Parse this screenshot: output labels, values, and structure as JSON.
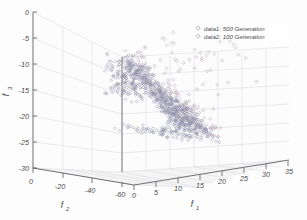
{
  "chart_data": {
    "type": "scatter",
    "title": "",
    "projection": "3d",
    "xlabel": "f_1",
    "ylabel": "f_2",
    "zlabel": "f_3",
    "xlabel_base": "f",
    "xlabel_sub": "1",
    "ylabel_base": "f",
    "ylabel_sub": "2",
    "zlabel_base": "f",
    "zlabel_sub": "3",
    "xlim": [
      0,
      35
    ],
    "ylim": [
      0,
      -60
    ],
    "zlim": [
      -30,
      0
    ],
    "xticks": [
      "0",
      "5",
      "10",
      "15",
      "20",
      "25",
      "30",
      "35"
    ],
    "xtick_values": [
      0,
      5,
      10,
      15,
      20,
      25,
      30,
      35
    ],
    "yticks": [
      "0",
      "-20",
      "-40",
      "-60"
    ],
    "ytick_values": [
      0,
      -20,
      -40,
      -60
    ],
    "zticks": [
      "0",
      "-5",
      "-10",
      "-15",
      "-20",
      "-25",
      "-30"
    ],
    "ztick_values": [
      0,
      -5,
      -10,
      -15,
      -20,
      -25,
      -30
    ],
    "grid": true,
    "legend_position": "upper-right",
    "marker": "diamond",
    "series": [
      {
        "name": "data1: 500 Generation",
        "label": "data1: 500 Generation",
        "color": "#8e8ea8",
        "marker": "diamond",
        "count": 500,
        "generation": 500,
        "description": "dense descending band from upper-left to lower-right"
      },
      {
        "name": "data2: 100 Generation",
        "label": "data2: 100 Generation",
        "color": "#a78fa0",
        "marker": "diamond",
        "count": 100,
        "generation": 100,
        "description": "sparser scattered points including right-side outliers"
      }
    ]
  },
  "legend": {
    "entries": [
      {
        "label": "data1: 500 Generation"
      },
      {
        "label": "data2: 100 Generation"
      }
    ]
  },
  "axes": {
    "x": {
      "label_base": "f",
      "label_sub": "1",
      "ticks": [
        "0",
        "5",
        "10",
        "15",
        "20",
        "25",
        "30",
        "35"
      ]
    },
    "y": {
      "label_base": "f",
      "label_sub": "2",
      "ticks": [
        "0",
        "-20",
        "-40",
        "-60"
      ]
    },
    "z": {
      "label_base": "f",
      "label_sub": "3",
      "ticks": [
        "0",
        "-5",
        "-10",
        "-15",
        "-20",
        "-25",
        "-30"
      ]
    }
  }
}
